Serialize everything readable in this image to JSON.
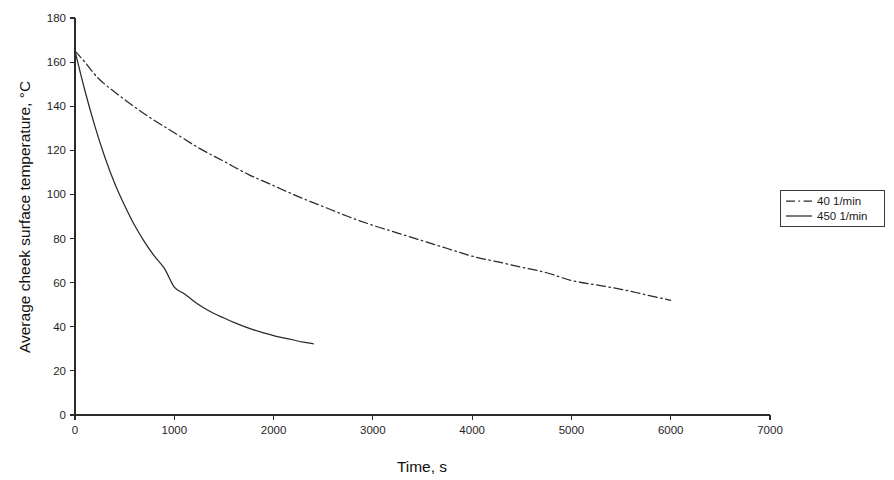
{
  "chart_data": {
    "type": "line",
    "title": "",
    "xlabel": "Time, s",
    "ylabel": "Average cheek surface temperature, °C",
    "xlim": [
      0,
      7000
    ],
    "ylim": [
      0,
      180
    ],
    "xticks": [
      0,
      1000,
      2000,
      3000,
      4000,
      5000,
      6000,
      7000
    ],
    "yticks": [
      0,
      20,
      40,
      60,
      80,
      100,
      120,
      140,
      160,
      180
    ],
    "xtick_labels": [
      "0",
      "1000",
      "2000",
      "3000",
      "4000",
      "5000",
      "6000",
      "7000"
    ],
    "ytick_labels": [
      "0",
      "20",
      "40",
      "60",
      "80",
      "100",
      "120",
      "140",
      "160",
      "180"
    ],
    "grid": false,
    "legend_position": "right",
    "series": [
      {
        "name": "40 1/min",
        "style": "dash-dot",
        "color": "#2a2a2a",
        "x": [
          0,
          100,
          250,
          500,
          750,
          1000,
          1250,
          1500,
          1750,
          2000,
          2250,
          2500,
          2750,
          3000,
          3250,
          3500,
          3750,
          4000,
          4250,
          4500,
          4750,
          5000,
          5250,
          5500,
          5750,
          6000
        ],
        "y": [
          165,
          160,
          152,
          143,
          135,
          128,
          121,
          115,
          109,
          104,
          99,
          94.5,
          90,
          86,
          82.5,
          79,
          75.5,
          72,
          69.5,
          67,
          64.5,
          61,
          59,
          57,
          54.5,
          52
        ]
      },
      {
        "name": "450 1/min",
        "style": "solid",
        "color": "#2a2a2a",
        "x": [
          0,
          100,
          200,
          300,
          400,
          500,
          600,
          700,
          800,
          900,
          1000,
          1100,
          1200,
          1300,
          1400,
          1500,
          1600,
          1700,
          1800,
          1900,
          2000,
          2100,
          2200,
          2300,
          2400
        ],
        "y": [
          165,
          147,
          131,
          117,
          105,
          95,
          86,
          78.5,
          72,
          66.5,
          58,
          55,
          51.5,
          48.5,
          46,
          44,
          42,
          40.2,
          38.6,
          37.2,
          36,
          35,
          34,
          33,
          32.3
        ]
      }
    ],
    "legend_entries": [
      {
        "label": "40 1/min",
        "style": "dash-dot"
      },
      {
        "label": "450 1/min",
        "style": "solid"
      }
    ]
  }
}
